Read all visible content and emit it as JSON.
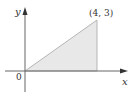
{
  "diagram": {
    "type": "coordinate-plot",
    "x_axis_label": "x",
    "y_axis_label": "y",
    "origin_label": "0",
    "point_label": "(4, 3)",
    "region": {
      "shape": "triangle",
      "vertices": [
        [
          0,
          0
        ],
        [
          4,
          0
        ],
        [
          4,
          3
        ]
      ],
      "fill": "#e6e6e6",
      "stroke": "#b0b0b0"
    },
    "axis_color": "#555555"
  }
}
